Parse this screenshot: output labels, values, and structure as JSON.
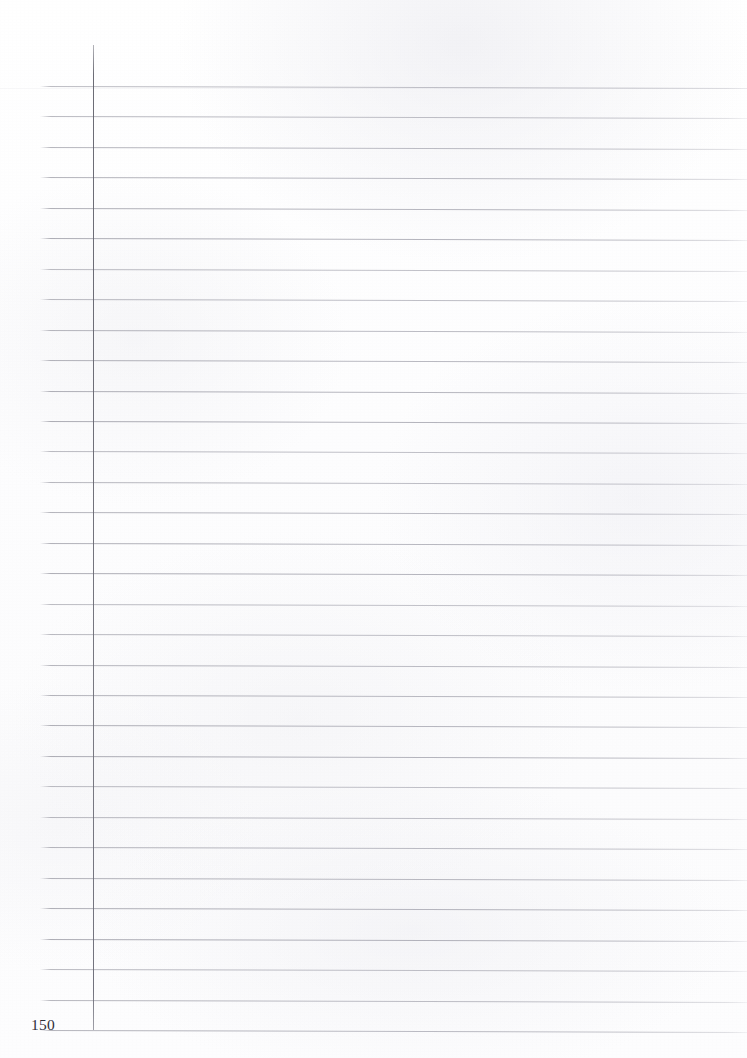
{
  "document": {
    "kind": "scanned-ruled-notebook-page",
    "page_number": "150",
    "page_width": 747,
    "page_height": 1058,
    "content_text": "",
    "colors": {
      "paper": "#fdfdfd",
      "rule_line": "#a9a9b1",
      "margin_rule": "#6a6a72",
      "folio_text": "#30303a"
    }
  },
  "layout": {
    "rules": {
      "count": 32,
      "first_y": 86,
      "spacing": 30.45,
      "start_x": 40,
      "end_x": 747,
      "skew_px": 2
    },
    "margin_rule": {
      "x": 93,
      "top_y": 45,
      "bottom_y": 1030
    },
    "folio": {
      "x": 31,
      "baseline_y": 1030
    }
  }
}
